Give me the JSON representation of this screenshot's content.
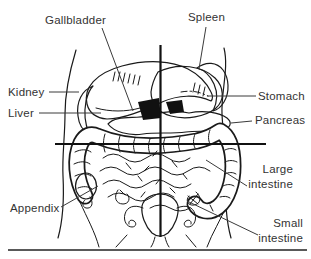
{
  "diagram": {
    "labels": {
      "gallbladder": "Gallbladder",
      "spleen": "Spleen",
      "kidney": "Kidney",
      "liver": "Liver",
      "stomach": "Stomach",
      "pancreas": "Pancreas",
      "appendix": "Appendix",
      "large_intestine": {
        "line1": "Large",
        "line2": "intestine"
      },
      "small_intestine": {
        "line1": "Small",
        "line2": "intestine"
      }
    },
    "colors": {
      "ink": "#1a1a1a",
      "label_text": "#333333",
      "background": "#ffffff"
    }
  }
}
